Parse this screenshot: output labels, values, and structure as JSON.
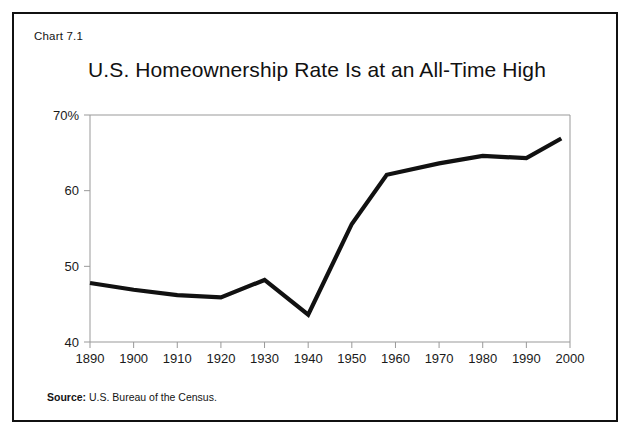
{
  "figure": {
    "chart_number": "Chart 7.1",
    "title": "U.S. Homeownership Rate Is at an All-Time High",
    "source_label": "Source:",
    "source_text": " U.S. Bureau of the Census."
  },
  "colors": {
    "line": "#111111",
    "frame": "#111111",
    "axis": "#999999",
    "text": "#111111",
    "background": "#ffffff"
  },
  "chart_data": {
    "type": "line",
    "title": "U.S. Homeownership Rate Is at an All-Time High",
    "xlabel": "",
    "ylabel": "",
    "xlim": [
      1890,
      2000
    ],
    "ylim": [
      40,
      70
    ],
    "grid": false,
    "legend": false,
    "x_tick_labels": [
      "1890",
      "1900",
      "1910",
      "1920",
      "1930",
      "1940",
      "1950",
      "1960",
      "1970",
      "1980",
      "1990",
      "2000"
    ],
    "x_ticks": [
      1890,
      1900,
      1910,
      1920,
      1930,
      1940,
      1950,
      1960,
      1970,
      1980,
      1990,
      2000
    ],
    "y_tick_labels": [
      "70%",
      "60",
      "50",
      "40"
    ],
    "y_ticks": [
      70,
      60,
      50,
      40
    ],
    "series": [
      {
        "name": "U.S. Homeownership Rate",
        "x": [
          1890,
          1900,
          1910,
          1920,
          1930,
          1940,
          1950,
          1958,
          1970,
          1980,
          1990,
          1998
        ],
        "values": [
          47.8,
          46.9,
          46.2,
          45.9,
          48.2,
          43.6,
          55.6,
          62.1,
          63.6,
          64.6,
          64.3,
          66.9
        ]
      }
    ]
  }
}
